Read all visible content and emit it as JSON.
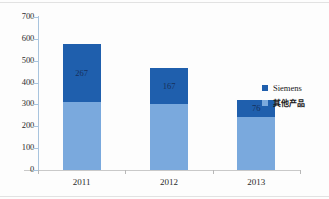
{
  "chart_data": {
    "type": "bar",
    "stacked": true,
    "title": "",
    "xlabel": "",
    "ylabel": "",
    "categories": [
      "2011",
      "2012",
      "2013"
    ],
    "ylim": [
      0,
      700
    ],
    "yticks": [
      0,
      100,
      200,
      300,
      400,
      500,
      600,
      700
    ],
    "ytick_labels": [
      "0",
      "100",
      "200",
      "300",
      "400",
      "500",
      "600",
      "700"
    ],
    "grid": false,
    "legend_position": "right",
    "series": [
      {
        "name": "Siemens",
        "color": "#1f5fad",
        "values": [
          267,
          167,
          76
        ],
        "data_labels": [
          "267",
          "167",
          "76"
        ]
      },
      {
        "name": "其他产品",
        "color": "#7aa9dd",
        "values": [
          311,
          301,
          244
        ],
        "data_labels": [
          "",
          "",
          ""
        ]
      }
    ],
    "totals": [
      578,
      468,
      320
    ]
  },
  "legend": {
    "items": [
      {
        "label": "Siemens",
        "color": "#1f5fad",
        "cjk": false
      },
      {
        "label": "其他产品",
        "color": "#7aa9dd",
        "cjk": true
      }
    ]
  },
  "axis": {
    "y_labels": [
      "700",
      "600",
      "500",
      "400",
      "300",
      "200",
      "100",
      "0"
    ],
    "x_labels": [
      "2011",
      "2012",
      "2013"
    ]
  },
  "colors": {
    "siemens": "#1f5fad",
    "other": "#7aa9dd",
    "axis": "#a8c4de",
    "text": "#2c2c2c",
    "background": "#fdfdfd"
  }
}
